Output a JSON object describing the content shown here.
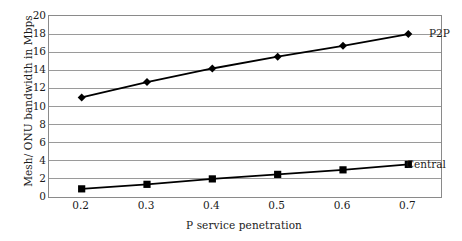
{
  "chart_data": {
    "type": "line",
    "title": "",
    "subtitle": "",
    "xlabel": "P service penetration",
    "ylabel": "Mesh/ ONU bandwidth in Mbps",
    "x": [
      0.2,
      0.3,
      0.4,
      0.5,
      0.6,
      0.7
    ],
    "categories": [
      "0.2",
      "0.3",
      "0.4",
      "0.5",
      "0.6",
      "0.7"
    ],
    "xlim": [
      0.15,
      0.75
    ],
    "ylim": [
      0,
      20
    ],
    "ytick_step": 2,
    "yticks": [
      0,
      2,
      4,
      6,
      8,
      10,
      12,
      14,
      16,
      18,
      20
    ],
    "ytick_labels": [
      "0",
      "2",
      "4",
      "6",
      "8",
      "10",
      "12",
      "14",
      "16",
      "18",
      "20"
    ],
    "grid": "horizontal",
    "legend_position": "inline-annotations",
    "series": [
      {
        "name": "P2P",
        "marker": "diamond",
        "color": "#000000",
        "values": [
          11.0,
          12.7,
          14.2,
          15.5,
          16.7,
          18.0
        ],
        "label_text": "P2P"
      },
      {
        "name": "Central",
        "marker": "square",
        "color": "#000000",
        "values": [
          0.9,
          1.4,
          2.0,
          2.5,
          3.0,
          3.6
        ],
        "label_text": "Central"
      }
    ],
    "annotations": [
      {
        "text": "P2P",
        "series": "P2P"
      },
      {
        "text": "Central",
        "series": "Central"
      }
    ]
  },
  "axes": {
    "y_title": "Mesh/ ONU bandwidth in Mbps",
    "x_title": "P service penetration"
  },
  "colors": {
    "line": "#000000",
    "marker": "#000000",
    "gridline": "#9a9a9a",
    "border": "#8a8a8a",
    "background": "#ffffff",
    "text": "#1a1a1a"
  }
}
